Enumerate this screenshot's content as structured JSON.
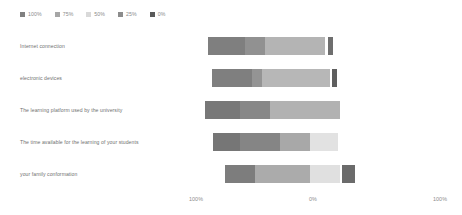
{
  "legend": {
    "position": "top-left",
    "items": [
      {
        "label": "100%",
        "color": "#808080"
      },
      {
        "label": "75%",
        "color": "#a6a6a6"
      },
      {
        "label": "50%",
        "color": "#d9d9d9"
      },
      {
        "label": "25%",
        "color": "#8c8c8c"
      },
      {
        "label": "0%",
        "color": "#595959"
      }
    ]
  },
  "axis": {
    "ticks": [
      {
        "label": "100%",
        "x": 196
      },
      {
        "label": "0%",
        "x": 313
      },
      {
        "label": "100%",
        "x": 440
      }
    ]
  },
  "chart_data": {
    "type": "bar",
    "subtype": "diverging-stacked-likert",
    "title": "",
    "xlabel": "",
    "ylabel": "",
    "orientation": "horizontal",
    "grid": false,
    "legend_position": "top-left",
    "xlim": [
      -100,
      100
    ],
    "categories": [
      "Internet connection",
      "electronic devices",
      "The learning platform used by the university",
      "The time available for the learning of your students",
      "your family conformation"
    ],
    "series": [
      {
        "name": "100%",
        "color": "#808080",
        "values": [
          30,
          32,
          28,
          22,
          24
        ]
      },
      {
        "name": "75%",
        "color": "#a6a6a6",
        "values": [
          16,
          8,
          24,
          32,
          44
        ]
      },
      {
        "name": "50%",
        "color": "#d9d9d9",
        "values": [
          48,
          55,
          56,
          24,
          24
        ]
      },
      {
        "name": "25%",
        "color": "#8c8c8c",
        "values": [
          0,
          0,
          0,
          22,
          0
        ]
      },
      {
        "name": "0%",
        "color": "#595959",
        "values": [
          4,
          4,
          0,
          0,
          10
        ]
      }
    ],
    "bars": [
      {
        "category": "Internet connection",
        "start_px": 208,
        "segments": [
          {
            "name": "100%",
            "color": "#7f7f7f",
            "width_px": 37
          },
          {
            "name": "75%",
            "color": "#919191",
            "width_px": 20
          },
          {
            "name": "50%",
            "color": "#b4b4b4",
            "width_px": 60
          },
          {
            "name": "gap",
            "color": "#ffffff",
            "width_px": 3
          },
          {
            "name": "0%",
            "color": "#6e6e6e",
            "width_px": 5
          }
        ]
      },
      {
        "category": "electronic devices",
        "start_px": 212,
        "segments": [
          {
            "name": "100%",
            "color": "#7f7f7f",
            "width_px": 40
          },
          {
            "name": "75%",
            "color": "#949494",
            "width_px": 10
          },
          {
            "name": "50%",
            "color": "#b7b7b7",
            "width_px": 68
          },
          {
            "name": "gap",
            "color": "#ffffff",
            "width_px": 2
          },
          {
            "name": "0%",
            "color": "#5f5f5f",
            "width_px": 5
          }
        ]
      },
      {
        "category": "The learning platform used by the university",
        "start_px": 205,
        "segments": [
          {
            "name": "100%",
            "color": "#787878",
            "width_px": 35
          },
          {
            "name": "75%",
            "color": "#878787",
            "width_px": 30
          },
          {
            "name": "50%",
            "color": "#b2b2b2",
            "width_px": 70
          }
        ]
      },
      {
        "category": "The time available for the learning of your students",
        "start_px": 213,
        "segments": [
          {
            "name": "100%",
            "color": "#767676",
            "width_px": 27
          },
          {
            "name": "75%",
            "color": "#858585",
            "width_px": 40
          },
          {
            "name": "50%",
            "color": "#a8a8a8",
            "width_px": 30
          },
          {
            "name": "25%",
            "color": "#e2e2e2",
            "width_px": 28
          }
        ]
      },
      {
        "category": "your family conformation",
        "start_px": 225,
        "segments": [
          {
            "name": "100%",
            "color": "#7d7d7d",
            "width_px": 30
          },
          {
            "name": "75%",
            "color": "#ababab",
            "width_px": 55
          },
          {
            "name": "50%",
            "color": "#e0e0e0",
            "width_px": 30
          },
          {
            "name": "gap",
            "color": "#ffffff",
            "width_px": 2
          },
          {
            "name": "0%",
            "color": "#6b6b6b",
            "width_px": 13
          }
        ]
      }
    ]
  }
}
